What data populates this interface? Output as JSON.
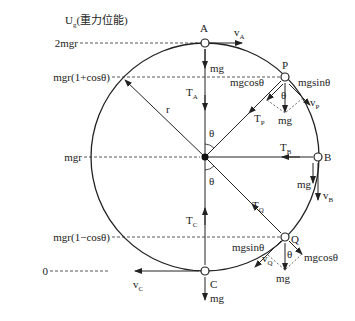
{
  "title": {
    "main": "U",
    "sub": "g",
    "rest": "(重力位能)"
  },
  "levels": [
    {
      "label": "2mgr",
      "y": 43
    },
    {
      "label": "mgr(1+cosθ)",
      "y": 77
    },
    {
      "label": "mgr",
      "y": 157
    },
    {
      "label": "mgr(1−cosθ)",
      "y": 237
    },
    {
      "label": "0",
      "y": 271
    }
  ],
  "points": {
    "A": "A",
    "B": "B",
    "C": "C",
    "P": "P",
    "Q": "Q"
  },
  "labels": {
    "radius": "r",
    "theta": "θ",
    "mg": "mg",
    "mgcos": "mgcosθ",
    "mgsin": "mgsinθ",
    "T": "T",
    "v": "v",
    "sub_A": "A",
    "sub_B": "B",
    "sub_C": "C",
    "sub_P": "P",
    "sub_Q": "Q"
  },
  "colors": {
    "stroke": "#222222",
    "dashed": "#444444"
  }
}
